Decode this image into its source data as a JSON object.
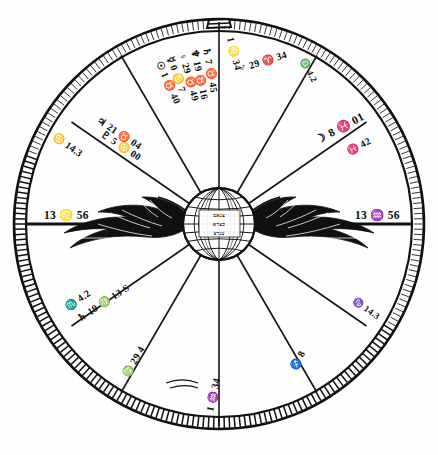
{
  "figure": {
    "kind": "astrological-birth-chart-wheel",
    "style": "vintage-engraving",
    "width": 438,
    "height": 455,
    "ink_color": "#111111",
    "paper_color": "#ffffff"
  },
  "chart_data": {
    "type": "table",
    "title": "",
    "subtitle": "",
    "xlabel": "",
    "ylabel": "",
    "center_emblem": {
      "name": "winged-globe",
      "description": "globe with latitude and longitude grid flanked by outspread wings",
      "inscription_lines": [
        "צנאמ",
        "כצרא",
        "ענרצ"
      ]
    },
    "houses": 12,
    "cusps": [
      {
        "id": "asc",
        "position": "left",
        "label": "13 ♌ 56",
        "degree": 13,
        "sign": "Leo",
        "minute": 56,
        "angle_deg": 180
      },
      {
        "id": "dsc",
        "position": "right",
        "label": "13 ♒ 56",
        "degree": 13,
        "sign": "Aquarius",
        "minute": 56,
        "angle_deg": 0
      },
      {
        "id": "h11",
        "position": "upper-left",
        "label": "♋ 14.3",
        "degree": 14,
        "sign": "Cancer",
        "minute": 3,
        "angle_deg": 210
      },
      {
        "id": "h5",
        "position": "lower-right",
        "label": "♑ 14.3",
        "degree": 14,
        "sign": "Capricorn",
        "minute": 3,
        "angle_deg": 30
      },
      {
        "id": "h2",
        "position": "lower-left",
        "label": "♏ 4.2",
        "degree": 4,
        "sign": "Scorpio",
        "minute": 2,
        "angle_deg": 150
      },
      {
        "id": "h8",
        "position": "upper-right",
        "label": "♎ 4.2",
        "degree": 4,
        "sign": "Taurus",
        "minute": 2,
        "angle_deg": 330
      },
      {
        "id": "h3",
        "position": "bottom-left",
        "label": "♍ 29 4",
        "degree": 29,
        "sign": "Virgo",
        "minute": 4,
        "angle_deg": 120
      },
      {
        "id": "h9",
        "position": "top-right",
        "label": "♐ 8",
        "degree": 8,
        "sign": "Sagittarius",
        "minute": 0,
        "angle_deg": 300
      },
      {
        "id": "ic",
        "position": "bottom",
        "label": "1 ♒ 34",
        "degree": 1,
        "sign": "Aquarius",
        "minute": 34,
        "angle_deg": 90
      },
      {
        "id": "mc",
        "position": "top",
        "label": "1 ♌ 34",
        "degree": 1,
        "sign": "Leo",
        "minute": 34,
        "angle_deg": 270
      },
      {
        "id": "h12",
        "position": "upper-left-2",
        "label": "♓ 42",
        "degree": 0,
        "sign": "Pisces",
        "minute": 42,
        "angle_deg": 345
      },
      {
        "id": "h6",
        "position": "lower-right-2",
        "label": "♓ 42",
        "degree": 0,
        "sign": "Pisces",
        "minute": 42,
        "angle_deg": 15
      }
    ],
    "planets": [
      {
        "symbol": "♄",
        "name": "Uranus",
        "label": "♄ 7 ♉ 45",
        "degree": 7,
        "sign": "Gemini",
        "minute": 45,
        "house_zone": "top-left"
      },
      {
        "symbol": "♆",
        "name": "Neptune",
        "label": "♆ 19 ♉ 16",
        "degree": 19,
        "sign": "Gemini",
        "minute": 16,
        "house_zone": "top-left"
      },
      {
        "symbol": "♀",
        "name": "Venus",
        "label": "♀ 29 ♉ 49",
        "degree": 29,
        "sign": "Gemini",
        "minute": 49,
        "house_zone": "top-left"
      },
      {
        "symbol": "☿",
        "name": "Mercury",
        "label": "☿ 0 ♋ 7",
        "degree": 0,
        "sign": "Cancer",
        "minute": 7,
        "house_zone": "top-left"
      },
      {
        "symbol": "☉",
        "name": "Sun",
        "label": "☉ 1 ♉ 40",
        "degree": 1,
        "sign": "Gemini",
        "minute": 40,
        "house_zone": "top-left"
      },
      {
        "symbol": "♃",
        "name": "Jupiter",
        "label": "♃ 21 ♉ 04",
        "degree": 21,
        "sign": "Gemini",
        "minute": 4,
        "house_zone": "upper-left"
      },
      {
        "symbol": "♇",
        "name": "Pluto",
        "label": "♇ 5 ♋ 00",
        "degree": 5,
        "sign": "Cancer",
        "minute": 0,
        "house_zone": "upper-left"
      },
      {
        "symbol": "♂",
        "name": "Mars",
        "label": "♂ 29 ♈ 34",
        "degree": 29,
        "sign": "Aries",
        "minute": 34,
        "house_zone": "top-right"
      },
      {
        "symbol": "☽",
        "name": "Moon",
        "label": "☽ 8 ♓ 01",
        "degree": 8,
        "sign": "Pisces",
        "minute": 1,
        "house_zone": "right"
      },
      {
        "symbol": "♄",
        "name": "Saturn",
        "label": "♄ 19 ♍ 13 S",
        "degree": 19,
        "sign": "Virgo",
        "minute": 13,
        "house_zone": "lower-left"
      }
    ],
    "legend": [],
    "grid": false
  },
  "labels": {
    "asc": "13 ♌ 56",
    "dsc": "13 ♒ 56",
    "mc": "1 ♌ 34",
    "ic": "1 ♒ 34",
    "cusp_cancer_14": "♋ 14.3",
    "cusp_capricorn_14": "♑ 14.3",
    "cusp_scorpio_4": "♏ 4.2",
    "cusp_taurus_4": "♎ 4.2",
    "cusp_virgo_29": "♍ 29 4",
    "cusp_sag_8": "♐ 8",
    "cusp_pisces_42": "♓ 42",
    "cusp_pisces_42b": "♓ 42",
    "moon": "☽ 8 ♓ 01",
    "mars": "♂ 29 ♈ 34",
    "saturn": "♄ 19 ♍ 13 S",
    "jupiter": "♃ 21 ♉ 04",
    "pluto": "♇ 5 ♋ 00",
    "uranus": "♄ 7 ♉ 45",
    "neptune": "♆ 19 ♉ 16",
    "venus": "♀ 29 ♉ 49",
    "mercury": "☿ 0 ♋ 7",
    "sun": "☉ 1 ♉ 40"
  },
  "emblem": {
    "core_line_1": "צנאמ",
    "core_line_2": "כצרא",
    "core_line_3": "ענרצ"
  }
}
